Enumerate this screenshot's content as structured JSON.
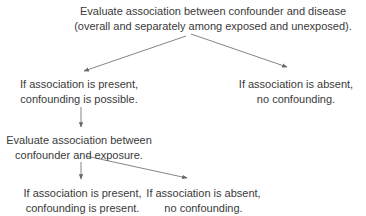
{
  "diagram": {
    "type": "flowchart",
    "nodes": {
      "root": {
        "line1": "Evaluate association between confounder and disease",
        "line2": "(overall and separately among exposed and unexposed)."
      },
      "present1": {
        "line1": "If association is present,",
        "line2": "confounding is possible."
      },
      "absent1": {
        "line1": "If association is absent,",
        "line2": "no confounding."
      },
      "eval2": {
        "line1": "Evaluate association between",
        "line2": "confounder and exposure."
      },
      "present2": {
        "line1": "If association is present,",
        "line2": "confounding is present."
      },
      "absent2": {
        "line1": "If association is absent,",
        "line2": "no confounding."
      }
    },
    "edges": [
      {
        "from": "root",
        "to": "present1"
      },
      {
        "from": "root",
        "to": "absent1"
      },
      {
        "from": "present1",
        "to": "eval2"
      },
      {
        "from": "eval2",
        "to": "present2"
      },
      {
        "from": "eval2",
        "to": "absent2"
      }
    ],
    "colors": {
      "text": "#3a3a3a",
      "arrow": "#666666",
      "background": "#ffffff"
    }
  }
}
